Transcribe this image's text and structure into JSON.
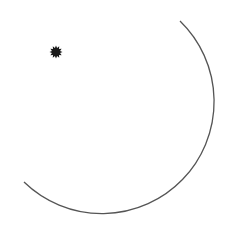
{
  "figure": {
    "width": 230,
    "height": 247,
    "background": "#ffffff",
    "arc": {
      "center": [
        107,
        110
      ],
      "radius": 105,
      "start": [
        180,
        21
      ],
      "end": [
        24,
        182
      ],
      "stroke": "#555555",
      "stroke_width": 1.3
    },
    "star": {
      "center": [
        56,
        52
      ],
      "outer_radius": 6.5,
      "inner_radius": 4.2,
      "points": 12,
      "fill": "#1a1a1a"
    }
  }
}
